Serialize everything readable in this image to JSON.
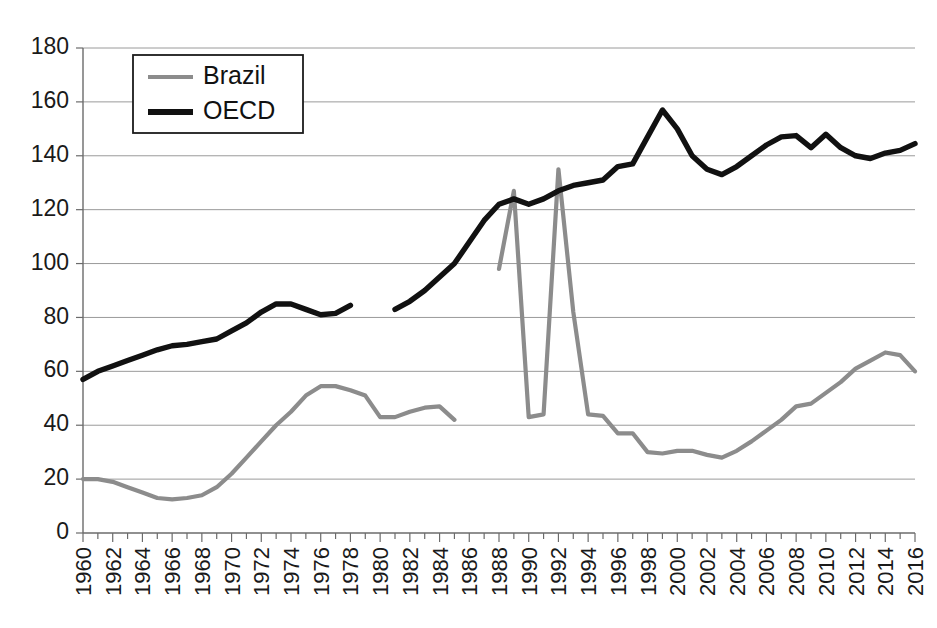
{
  "chart_data": {
    "type": "line",
    "title": "",
    "xlabel": "",
    "ylabel": "",
    "xlim": [
      1960,
      2016
    ],
    "ylim": [
      0,
      180
    ],
    "ytick_step": 20,
    "xtick_step": 2,
    "grid": true,
    "legend_position": "top-left",
    "yticks": [
      0,
      20,
      40,
      60,
      80,
      100,
      120,
      140,
      160,
      180
    ],
    "xticks": [
      1960,
      1962,
      1964,
      1966,
      1968,
      1970,
      1972,
      1974,
      1976,
      1978,
      1980,
      1982,
      1984,
      1986,
      1988,
      1990,
      1992,
      1994,
      1996,
      1998,
      2000,
      2002,
      2004,
      2006,
      2008,
      2010,
      2012,
      2014,
      2016
    ],
    "series": [
      {
        "name": "Brazil",
        "color": "#8c8c8c",
        "segments": [
          {
            "x": [
              1960,
              1961,
              1962,
              1963,
              1964,
              1965,
              1966,
              1967,
              1968,
              1969,
              1970,
              1971,
              1972,
              1973,
              1974,
              1975,
              1976,
              1977,
              1978,
              1979,
              1980,
              1981,
              1982,
              1983,
              1984,
              1985
            ],
            "y": [
              20,
              20,
              19,
              17,
              15,
              13,
              12.5,
              13,
              14,
              17,
              22,
              28,
              34,
              40,
              45,
              51,
              54.5,
              54.5,
              53,
              51,
              43,
              43,
              45,
              46.5,
              47,
              42
            ]
          },
          {
            "x": [
              1988,
              1989,
              1990,
              1991,
              1992,
              1993,
              1994,
              1995,
              1996,
              1997,
              1998,
              1999,
              2000,
              2001,
              2002,
              2003,
              2004,
              2005,
              2006,
              2007,
              2008,
              2009,
              2010,
              2011,
              2012,
              2013,
              2014,
              2015,
              2016
            ],
            "y": [
              98,
              127,
              43,
              44,
              135,
              82,
              44,
              43.5,
              37,
              37,
              30,
              29.5,
              30.5,
              30.5,
              29,
              28,
              30.5,
              34,
              38,
              42,
              47,
              48,
              52,
              56,
              61,
              64,
              67,
              66,
              60
            ]
          }
        ]
      },
      {
        "name": "OECD",
        "color": "#111111",
        "segments": [
          {
            "x": [
              1960,
              1961,
              1962,
              1963,
              1964,
              1965,
              1966,
              1967,
              1968,
              1969,
              1970,
              1971,
              1972,
              1973,
              1974,
              1975,
              1976,
              1977,
              1978
            ],
            "y": [
              57,
              60,
              62,
              64,
              66,
              68,
              69.5,
              70,
              71,
              72,
              75,
              78,
              82,
              85,
              85,
              83,
              81,
              81.5,
              84.5
            ]
          },
          {
            "x": [
              1981,
              1982,
              1983,
              1984,
              1985,
              1986,
              1987,
              1988,
              1989,
              1990,
              1991,
              1992,
              1993,
              1994,
              1995,
              1996,
              1997,
              1998,
              1999,
              2000,
              2001,
              2002,
              2003,
              2004,
              2005,
              2006,
              2007,
              2008,
              2009,
              2010,
              2011,
              2012,
              2013,
              2014,
              2015,
              2016
            ],
            "y": [
              83,
              86,
              90,
              95,
              100,
              108,
              116,
              122,
              124,
              122,
              124,
              127,
              129,
              130,
              131,
              136,
              137,
              147,
              157,
              150,
              140,
              135,
              133,
              136,
              140,
              144,
              147,
              147.5,
              143,
              148,
              143,
              140,
              139,
              141,
              142,
              144.5
            ]
          }
        ]
      }
    ]
  },
  "legend": {
    "items": [
      {
        "label": "Brazil",
        "color": "#8c8c8c"
      },
      {
        "label": "OECD",
        "color": "#111111"
      }
    ]
  },
  "axes": {
    "y_labels": [
      "180",
      "160",
      "140",
      "120",
      "100",
      "80",
      "60",
      "40",
      "20",
      "0"
    ],
    "x_labels": [
      "1960",
      "1962",
      "1964",
      "1966",
      "1968",
      "1970",
      "1972",
      "1974",
      "1976",
      "1978",
      "1980",
      "1982",
      "1984",
      "1986",
      "1988",
      "1990",
      "1992",
      "1994",
      "1996",
      "1998",
      "2000",
      "2002",
      "2004",
      "2006",
      "2008",
      "2010",
      "2012",
      "2014",
      "2016"
    ]
  }
}
